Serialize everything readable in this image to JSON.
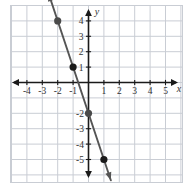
{
  "chart_data": {
    "type": "line",
    "title": "",
    "xlabel": "x",
    "ylabel": "y",
    "xlim": [
      -5,
      6
    ],
    "ylim": [
      -6,
      5
    ],
    "grid": true,
    "legend": null,
    "x_tick_labels": [
      "-4",
      "-3",
      "-2",
      "-1",
      "1",
      "2",
      "3",
      "4",
      "5"
    ],
    "x_tick_values": [
      -4,
      -3,
      -2,
      -1,
      1,
      2,
      3,
      4,
      5
    ],
    "y_tick_labels": [
      "4",
      "3",
      "2",
      "1",
      "-2",
      "-3",
      "-4",
      "-5"
    ],
    "y_tick_values": [
      4,
      3,
      2,
      1,
      -2,
      -3,
      -4,
      -5
    ],
    "series": [
      {
        "name": "line",
        "equation": "y = -3x - 2",
        "slope": -3,
        "intercept": -2,
        "color": "#555555",
        "arrows": "both",
        "x": [
          -2,
          -1,
          0,
          1
        ],
        "y": [
          4,
          1,
          -2,
          -5
        ],
        "endpoints": {
          "x_start": -2.6,
          "x_end": 1.45
        }
      }
    ],
    "points": [
      {
        "x": -2,
        "y": 4,
        "color": "#4a4a4a"
      },
      {
        "x": -1,
        "y": 1,
        "color": "#1a1a1a"
      },
      {
        "x": 0,
        "y": -2,
        "color": "#4a4a4a"
      },
      {
        "x": 1,
        "y": -5,
        "color": "#1a1a1a"
      }
    ],
    "colors": {
      "grid": "#c9cdd4",
      "axis": "#1a1a1a",
      "plot_border": "#c9cdd4",
      "background": "#ffffff",
      "tick_label": "#333333"
    }
  },
  "axis_names": {
    "x": "x",
    "y": "y"
  }
}
